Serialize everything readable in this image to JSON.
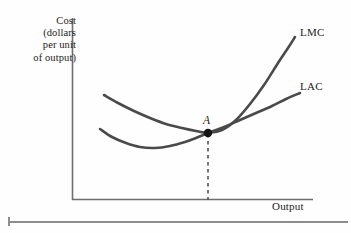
{
  "chart_data": {
    "type": "line",
    "title": "",
    "subtitle": "",
    "xlabel": "Output",
    "ylabel": "Cost (dollars per unit of output)",
    "ylabel_lines": [
      "Cost",
      "(dollars",
      "per unit",
      "of output)"
    ],
    "grid": false,
    "legend_position": "inline-right-of-curve-ends",
    "axes": {
      "x_axis_shown": true,
      "y_axis_shown": true,
      "tick_labels_x": [],
      "tick_labels_y": [],
      "xlim_note": "unlabeled quantity axis",
      "ylim_note": "unlabeled cost axis"
    },
    "series": [
      {
        "name": "LMC",
        "label": "LMC",
        "description": "Long-run marginal cost curve: falls from upper left, crosses LAC at its minimum, then rises steeply",
        "color": "#4a4a4a",
        "points": [
          [
            104,
            95
          ],
          [
            118,
            103
          ],
          [
            134,
            111
          ],
          [
            150,
            118
          ],
          [
            166,
            124
          ],
          [
            182,
            128
          ],
          [
            196,
            131
          ],
          [
            208,
            133
          ],
          [
            222,
            130
          ],
          [
            236,
            120
          ],
          [
            250,
            104
          ],
          [
            264,
            85
          ],
          [
            278,
            63
          ],
          [
            288,
            48
          ],
          [
            295,
            37
          ]
        ]
      },
      {
        "name": "LAC",
        "label": "LAC",
        "description": "Long-run average cost curve: U-shaped, minimum at the tangency point A",
        "color": "#4a4a4a",
        "points": [
          [
            100,
            129
          ],
          [
            112,
            137
          ],
          [
            126,
            143
          ],
          [
            140,
            147
          ],
          [
            155,
            148
          ],
          [
            170,
            146
          ],
          [
            185,
            142
          ],
          [
            196,
            138
          ],
          [
            208,
            133
          ],
          [
            224,
            127
          ],
          [
            240,
            120
          ],
          [
            256,
            113
          ],
          [
            272,
            106
          ],
          [
            286,
            99
          ],
          [
            300,
            93
          ]
        ]
      }
    ],
    "annotations": [
      {
        "name": "point-a",
        "label": "A",
        "style": "italic",
        "marker": "filled-dot",
        "x_px": 208,
        "y_px": 133,
        "label_x_px": 203,
        "label_y_px": 114,
        "meaning": "Tangency / intersection of LMC and LAC at the minimum of LAC"
      },
      {
        "name": "dropline-from-a",
        "label": "",
        "style": "dashed-vertical",
        "from_x_px": 208,
        "from_y_px": 134,
        "to_y_px": 200
      }
    ],
    "colors": {
      "curve": "#4a4a4a",
      "axis": "#6e6e6e",
      "text": "#1c1c1c",
      "background": "#fefefe",
      "dashed_line": "#4a4a4a",
      "bottom_rule": "#8d8d8d"
    },
    "geometry": {
      "axis_origin_x": 72,
      "axis_origin_y": 200,
      "y_axis_top": 18,
      "x_axis_right": 313
    }
  },
  "labels": {
    "y_axis": "Cost\n(dollars\nper unit\nof output)",
    "x_axis": "Output",
    "lmc": "LMC",
    "lac": "LAC",
    "point_a": "A"
  }
}
